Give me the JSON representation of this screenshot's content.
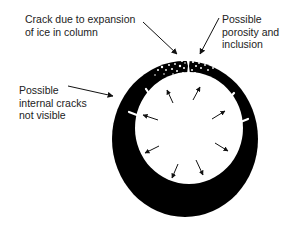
{
  "diagram": {
    "type": "cross-section",
    "labels": {
      "crack": "Crack due to expansion\nof ice in column",
      "porosity": "Possible\nporosity and\ninclusion",
      "internal": "Possible\ninternal cracks\nnot visible"
    },
    "colors": {
      "ring": "#000000",
      "background": "#ffffff",
      "text": "#222222"
    },
    "shapes": {
      "outer_ring": {
        "cx": 185,
        "cy": 139,
        "rx": 73,
        "ry": 78
      },
      "inner_bore": {
        "cx": 189,
        "cy": 128,
        "rx": 54,
        "ry": 56
      }
    },
    "leader_arrows": [
      {
        "for": "crack",
        "x1": 143,
        "y1": 22,
        "x2": 177,
        "y2": 54
      },
      {
        "for": "porosity",
        "x1": 219,
        "y1": 18,
        "x2": 200,
        "y2": 54
      },
      {
        "for": "internal",
        "x1": 68,
        "y1": 86,
        "x2": 113,
        "y2": 96
      }
    ],
    "expansion_arrows": [
      {
        "x1": 173,
        "y1": 103,
        "x2": 167,
        "y2": 90
      },
      {
        "x1": 193,
        "y1": 100,
        "x2": 200,
        "y2": 87
      },
      {
        "x1": 158,
        "y1": 120,
        "x2": 143,
        "y2": 115
      },
      {
        "x1": 212,
        "y1": 119,
        "x2": 225,
        "y2": 111
      },
      {
        "x1": 159,
        "y1": 146,
        "x2": 145,
        "y2": 153
      },
      {
        "x1": 215,
        "y1": 143,
        "x2": 228,
        "y2": 151
      },
      {
        "x1": 178,
        "y1": 164,
        "x2": 172,
        "y2": 178
      },
      {
        "x1": 196,
        "y1": 160,
        "x2": 203,
        "y2": 175
      }
    ],
    "crack_spikes": [
      {
        "x1": 146,
        "y1": 89,
        "x2": 152,
        "y2": 98
      },
      {
        "x1": 129,
        "y1": 112,
        "x2": 142,
        "y2": 117
      },
      {
        "x1": 234,
        "y1": 93,
        "x2": 226,
        "y2": 102
      },
      {
        "x1": 248,
        "y1": 119,
        "x2": 233,
        "y2": 125
      }
    ]
  }
}
